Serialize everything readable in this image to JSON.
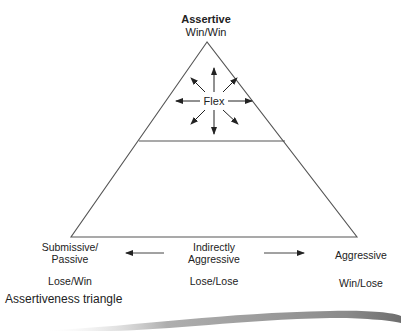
{
  "diagram": {
    "title": "Assertiveness triangle",
    "apex": {
      "heading": "Assertive",
      "outcome": "Win/Win"
    },
    "center": {
      "label": "Flex"
    },
    "bottom_left": {
      "line1": "Submissive/",
      "line2": "Passive",
      "outcome": "Lose/Win"
    },
    "bottom_middle": {
      "line1": "Indirectly",
      "line2": "Aggressive",
      "outcome": "Lose/Lose"
    },
    "bottom_right": {
      "line1": "Aggressive",
      "outcome": "Win/Lose"
    },
    "colors": {
      "line": "#555555",
      "text": "#222222",
      "shadow": "#8a8a8a"
    }
  }
}
